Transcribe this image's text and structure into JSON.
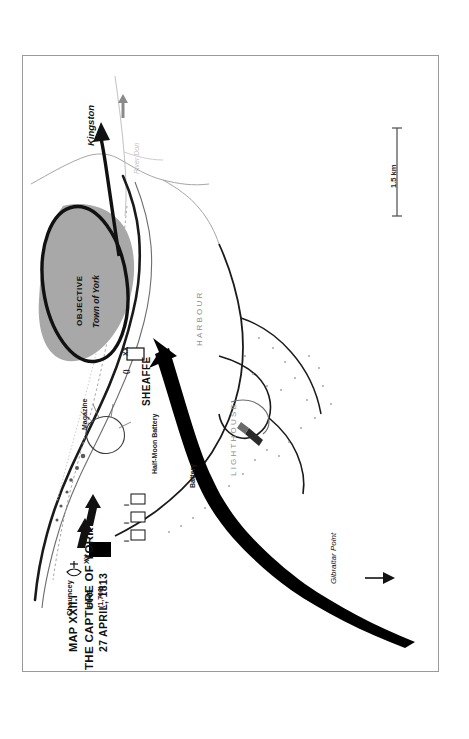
{
  "page": {
    "background": "#ffffff",
    "frame_color": "#9a9a9a"
  },
  "title": {
    "map_number": "MAP XXII.i",
    "line1": "THE CAPTURE OF YORK",
    "line2": "27 APRIL, 1813"
  },
  "scale": {
    "label": "1.5 km"
  },
  "places": {
    "kingston": "Kingston",
    "river_don": "River Don",
    "objective": "OBJECTIVE",
    "town_of_york": "Town of York",
    "harbour": "HARBOUR",
    "lighthouse": "LIGHTHOUSE",
    "magazine": "Magazine",
    "half_moon_battery": "Half-Moon Battery",
    "battery": "Battery",
    "gibraltar_point": "Gibraltar Point"
  },
  "units": {
    "sheaffe": {
      "name": "SHEAFFE",
      "echelon": "XX",
      "strength": "()"
    },
    "pike": {
      "name": "PIKE",
      "strength": "(1,700)",
      "echelon": "XX"
    },
    "chauncey": {
      "name": "Chauncey"
    },
    "companies": [
      {
        "echelon": "I"
      },
      {
        "echelon": "I"
      },
      {
        "echelon": "I"
      }
    ]
  },
  "colors": {
    "land_outline": "#1a1a1a",
    "objective_fill": "#a8a8a8",
    "water_line": "#b9b9b9",
    "arrow_black": "#000000",
    "gray_text": "#8d8d8d"
  }
}
